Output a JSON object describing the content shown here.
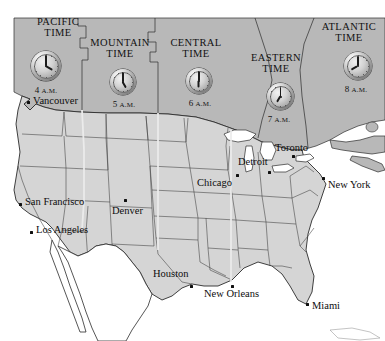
{
  "map": {
    "title": "North American Time Zones",
    "colors": {
      "canada_fill": "#b9b9b9",
      "usa_fill": "#d6d6d6",
      "usa_alt_fill": "#cfcfcf",
      "mexico_fill": "#ffffff",
      "ocean": "#ffffff",
      "border": "#2b2b2b",
      "state_border": "#3c3c3c",
      "text": "#111111",
      "zone_divider": "#e8e8e8"
    },
    "zones": [
      {
        "id": "pacific",
        "line1": "PACIFIC",
        "line2": "TIME",
        "time": "4",
        "ampm": "A.M.",
        "hour": 4,
        "minute": 0,
        "label_x": 23,
        "label_y": 17,
        "clock_x": 31,
        "clock_y": 51,
        "clock_size": 30,
        "time_x": 21,
        "time_y": 85
      },
      {
        "id": "mountain",
        "line1": "MOUNTAIN",
        "line2": "TIME",
        "time": "5",
        "ampm": "A.M.",
        "hour": 5,
        "minute": 0,
        "label_x": 88,
        "label_y": 38,
        "clock_x": 110,
        "clock_y": 69,
        "clock_size": 26,
        "time_x": 99,
        "time_y": 99
      },
      {
        "id": "central",
        "line1": "CENTRAL",
        "line2": "TIME",
        "time": "6",
        "ampm": "A.M.",
        "hour": 6,
        "minute": 0,
        "label_x": 164,
        "label_y": 38,
        "clock_x": 186,
        "clock_y": 68,
        "clock_size": 26,
        "time_x": 175,
        "time_y": 98
      },
      {
        "id": "eastern",
        "line1": "EASTERN",
        "line2": "TIME",
        "time": "7",
        "ampm": "A.M.",
        "hour": 7,
        "minute": 0,
        "label_x": 241,
        "label_y": 53,
        "clock_x": 267,
        "clock_y": 83,
        "clock_size": 27,
        "time_x": 254,
        "time_y": 114
      },
      {
        "id": "atlantic",
        "line1": "ATLANTIC",
        "line2": "TIME",
        "time": "8",
        "ampm": "A.M.",
        "hour": 8,
        "minute": 0,
        "label_x": 316,
        "label_y": 22,
        "clock_x": 344,
        "clock_y": 52,
        "clock_size": 28,
        "time_x": 331,
        "time_y": 84
      }
    ],
    "cities": [
      {
        "name": "Vancouver",
        "dot_x": 27,
        "dot_y": 101,
        "label_x": 33,
        "label_y": 95,
        "align": "left"
      },
      {
        "name": "San Francisco",
        "dot_x": 19,
        "dot_y": 203,
        "label_x": 25,
        "label_y": 196,
        "align": "left"
      },
      {
        "name": "Los Angeles",
        "dot_x": 30,
        "dot_y": 231,
        "label_x": 36,
        "label_y": 224,
        "align": "left"
      },
      {
        "name": "Denver",
        "dot_x": 124,
        "dot_y": 199,
        "label_x": 112,
        "label_y": 205,
        "align": "left"
      },
      {
        "name": "Houston",
        "dot_x": 190,
        "dot_y": 285,
        "label_x": 153,
        "label_y": 268,
        "align": "left"
      },
      {
        "name": "New Orleans",
        "dot_x": 231,
        "dot_y": 285,
        "label_x": 204,
        "label_y": 288,
        "align": "left"
      },
      {
        "name": "Chicago",
        "dot_x": 236,
        "dot_y": 174,
        "label_x": 197,
        "label_y": 177,
        "align": "left"
      },
      {
        "name": "Detroit",
        "dot_x": 268,
        "dot_y": 171,
        "label_x": 238,
        "label_y": 156,
        "align": "left"
      },
      {
        "name": "Toronto",
        "dot_x": 292,
        "dot_y": 155,
        "label_x": 275,
        "label_y": 142,
        "align": "left"
      },
      {
        "name": "New York",
        "dot_x": 322,
        "dot_y": 177,
        "label_x": 328,
        "label_y": 179,
        "align": "left"
      },
      {
        "name": "Miami",
        "dot_x": 306,
        "dot_y": 303,
        "label_x": 312,
        "label_y": 300,
        "align": "left"
      }
    ]
  }
}
